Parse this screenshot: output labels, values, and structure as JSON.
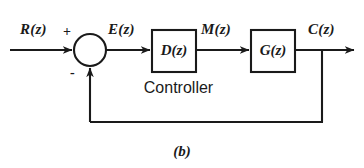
{
  "figure": {
    "caption": "(b)",
    "background_color": "#ffffff",
    "line_color": "#1a1a1a",
    "width": 364,
    "height": 168
  },
  "signals": {
    "input": "R(z)",
    "error": "E(z)",
    "manipulated": "M(z)",
    "output": "C(z)"
  },
  "summing_junction": {
    "name": "summing-junction",
    "plus_sign": "+",
    "minus_sign": "-",
    "center_x": 90,
    "center_y": 50,
    "radius": 16
  },
  "blocks": [
    {
      "id": "controller-block",
      "label": "D(z)",
      "annotation": "Controller",
      "x": 152,
      "y": 30,
      "width": 44,
      "height": 42
    },
    {
      "id": "plant-block",
      "label": "G(z)",
      "annotation": "",
      "x": 251,
      "y": 30,
      "width": 44,
      "height": 42
    }
  ],
  "annotations": {
    "controller": "Controller"
  },
  "paths": {
    "feedback_label": "",
    "feedback_y": 122,
    "branch_x": 322,
    "output_arrow_x": 356
  }
}
